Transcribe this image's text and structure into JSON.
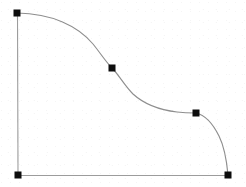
{
  "figure": {
    "background_color": "#ffffff",
    "width": 246,
    "height": 187
  },
  "style": {
    "curve_color": "#8e8e8e",
    "axis_color": "#9c9c9c",
    "knot_color": "#0d0d0d",
    "curve_stroke_width": 1.15,
    "axis_stroke_width": 1.1,
    "knot_size": 7
  },
  "chart_data": {
    "type": "line",
    "xlabel": "",
    "ylabel": "",
    "xlim": [
      0,
      246
    ],
    "ylim": [
      187,
      0
    ],
    "grid": false,
    "legend": "none",
    "series": [
      {
        "name": "spline",
        "x": [
          17,
          112,
          196,
          228
        ],
        "y": [
          13,
          68,
          113,
          175
        ],
        "marker": "square",
        "marker_filled": true
      }
    ],
    "knots": [
      {
        "label": "knot-1",
        "x": 17,
        "y": 13
      },
      {
        "label": "knot-2",
        "x": 112,
        "y": 68
      },
      {
        "label": "knot-3",
        "x": 196,
        "y": 113
      },
      {
        "label": "knot-4",
        "x": 228,
        "y": 175
      },
      {
        "label": "origin-corner",
        "x": 18,
        "y": 175
      }
    ],
    "annotations": []
  },
  "geometry": {
    "vertical_axis": {
      "x1": 17.5,
      "y1": 13,
      "x2": 18,
      "y2": 175
    },
    "horizontal_axis": {
      "x1": 18,
      "y1": 175.5,
      "x2": 228,
      "y2": 175.5
    },
    "curve_path": "M 17,13 C 52,13.5 78,26 93,44 C 101,54 106,62 112,68 C 119,75 124,85 133,94 C 144,104 160,110 177,112 C 185,113 191,113 196,113 C 205,115 213,124 219,136 C 225,148 227,164 228,175"
  }
}
